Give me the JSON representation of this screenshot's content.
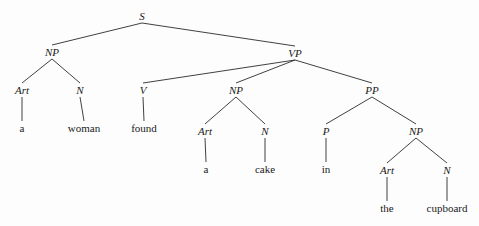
{
  "diagram": {
    "type": "syntax-tree",
    "title": "",
    "sentence": "a woman found a cake in the cupboard",
    "background_color": "#fdfdfd",
    "line_color": "#2b2b2b",
    "text_color": "#1a1a1a",
    "width": 479,
    "height": 226,
    "nodes": [
      {
        "id": "s",
        "label": "S",
        "kind": "category",
        "x": 142,
        "y": 16
      },
      {
        "id": "np1",
        "label": "NP",
        "kind": "category",
        "x": 52,
        "y": 52
      },
      {
        "id": "vp",
        "label": "VP",
        "kind": "category",
        "x": 295,
        "y": 53
      },
      {
        "id": "art1",
        "label": "Art",
        "kind": "category",
        "x": 22,
        "y": 90
      },
      {
        "id": "n1",
        "label": "N",
        "kind": "category",
        "x": 80,
        "y": 90
      },
      {
        "id": "v",
        "label": "V",
        "kind": "category",
        "x": 143,
        "y": 90
      },
      {
        "id": "np2",
        "label": "NP",
        "kind": "category",
        "x": 236,
        "y": 90
      },
      {
        "id": "pp",
        "label": "PP",
        "kind": "category",
        "x": 372,
        "y": 90
      },
      {
        "id": "leaf_a1",
        "label": "a",
        "kind": "leaf",
        "x": 22,
        "y": 128
      },
      {
        "id": "leaf_wom",
        "label": "woman",
        "kind": "leaf",
        "x": 84,
        "y": 128
      },
      {
        "id": "leaf_fnd",
        "label": "found",
        "kind": "leaf",
        "x": 144,
        "y": 128
      },
      {
        "id": "art2",
        "label": "Art",
        "kind": "category",
        "x": 205,
        "y": 131
      },
      {
        "id": "n2",
        "label": "N",
        "kind": "category",
        "x": 265,
        "y": 131
      },
      {
        "id": "p",
        "label": "P",
        "kind": "category",
        "x": 326,
        "y": 131
      },
      {
        "id": "np3",
        "label": "NP",
        "kind": "category",
        "x": 416,
        "y": 131
      },
      {
        "id": "leaf_a2",
        "label": "a",
        "kind": "leaf",
        "x": 206,
        "y": 169
      },
      {
        "id": "leaf_cak",
        "label": "cake",
        "kind": "leaf",
        "x": 265,
        "y": 169
      },
      {
        "id": "leaf_in",
        "label": "in",
        "kind": "leaf",
        "x": 326,
        "y": 169
      },
      {
        "id": "art3",
        "label": "Art",
        "kind": "category",
        "x": 387,
        "y": 170
      },
      {
        "id": "n3",
        "label": "N",
        "kind": "category",
        "x": 447,
        "y": 170
      },
      {
        "id": "leaf_the",
        "label": "the",
        "kind": "leaf",
        "x": 387,
        "y": 208
      },
      {
        "id": "leaf_cup",
        "label": "cupboard",
        "kind": "leaf",
        "x": 447,
        "y": 208
      }
    ],
    "edges": [
      {
        "from": "s",
        "to": "np1"
      },
      {
        "from": "s",
        "to": "vp"
      },
      {
        "from": "np1",
        "to": "art1"
      },
      {
        "from": "np1",
        "to": "n1"
      },
      {
        "from": "vp",
        "to": "v"
      },
      {
        "from": "vp",
        "to": "np2"
      },
      {
        "from": "vp",
        "to": "pp"
      },
      {
        "from": "art1",
        "to": "leaf_a1"
      },
      {
        "from": "n1",
        "to": "leaf_wom"
      },
      {
        "from": "v",
        "to": "leaf_fnd"
      },
      {
        "from": "np2",
        "to": "art2"
      },
      {
        "from": "np2",
        "to": "n2"
      },
      {
        "from": "pp",
        "to": "p"
      },
      {
        "from": "pp",
        "to": "np3"
      },
      {
        "from": "art2",
        "to": "leaf_a2"
      },
      {
        "from": "n2",
        "to": "leaf_cak"
      },
      {
        "from": "p",
        "to": "leaf_in"
      },
      {
        "from": "np3",
        "to": "art3"
      },
      {
        "from": "np3",
        "to": "n3"
      },
      {
        "from": "art3",
        "to": "leaf_the"
      },
      {
        "from": "n3",
        "to": "leaf_cup"
      }
    ]
  }
}
